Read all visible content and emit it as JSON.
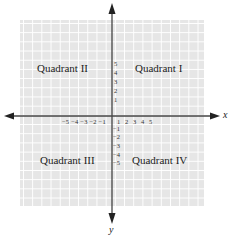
{
  "diagram": {
    "type": "cartesian-coordinate-plane",
    "colors": {
      "grid_fill": "#e6e6e6",
      "grid_lines": "#ffffff",
      "axes": "#444444",
      "text": "#222222"
    },
    "axes": {
      "x_label": "x",
      "y_label": "y"
    },
    "quadrants": {
      "q1": "Quadrant I",
      "q2": "Quadrant II",
      "q3": "Quadrant III",
      "q4": "Quadrant IV"
    },
    "x_ticks_negative": "−5 −4 −3 −2 −1",
    "x_ticks_positive": [
      "1",
      "2",
      "3",
      "4",
      "5"
    ],
    "y_ticks_positive": [
      "5",
      "4",
      "3",
      "2",
      "1"
    ],
    "y_ticks_negative": [
      "−1",
      "−2",
      "−3",
      "−4",
      "−5"
    ]
  }
}
